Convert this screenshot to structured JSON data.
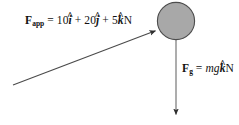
{
  "figure": {
    "type": "free-body-diagram",
    "background_color": "#ffffff",
    "stroke_color": "#3a3a3a",
    "ball": {
      "name": "mass-ball",
      "fill_color": "#a8a8a8",
      "stroke_color": "#4a4a4a",
      "center_x": 176,
      "center_y": 21,
      "radius": 19
    },
    "applied_force": {
      "label_parts": {
        "symbol": "F",
        "subscript": "app",
        "equals": "=",
        "i_coefficient": "10",
        "i_unit_vector": "i",
        "plus_1": "+",
        "j_coefficient": "20",
        "j_unit_vector": "j",
        "plus_2": "+",
        "k_coefficient": "5",
        "k_unit_vector": "k",
        "units": "N"
      },
      "label_plain": "F_app = 10i + 20j + 5k N",
      "arrow": {
        "tail_x": 13,
        "tail_y": 85,
        "tip_x": 158,
        "tip_y": 30,
        "direction": "up-right"
      }
    },
    "gravity_force": {
      "label_parts": {
        "symbol": "F",
        "subscript": "g",
        "equals": "=",
        "magnitude": "mg",
        "k_unit_vector": "k",
        "units": "N"
      },
      "label_plain": "F_g = mg k N",
      "arrow": {
        "tail_x": 176,
        "tail_y": 40,
        "tip_x": 176,
        "tip_y": 118,
        "direction": "down"
      }
    },
    "hat_glyph": "^"
  }
}
